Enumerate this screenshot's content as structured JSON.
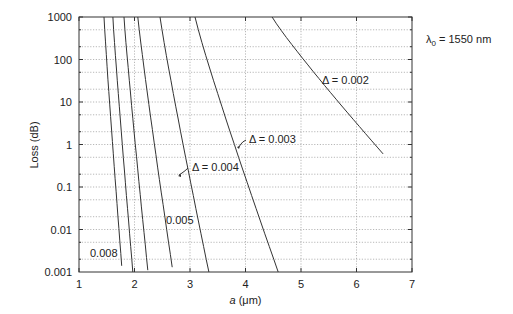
{
  "chart_data": {
    "type": "line",
    "title": "",
    "annotation": "λ₀ = 1550 nm",
    "xlabel": "a (μm)",
    "ylabel": "Loss (dB)",
    "xlim": [
      1,
      7
    ],
    "ylim": [
      0.001,
      1000
    ],
    "yscale": "log",
    "grid": true,
    "x_ticks": [
      "1",
      "2",
      "3",
      "4",
      "5",
      "6",
      "7"
    ],
    "y_ticks": [
      "1000",
      "100",
      "10",
      "1",
      "0.1",
      "0.01",
      "0.001"
    ],
    "legend": "none (inline labels)",
    "series": [
      {
        "name": "Δ=0.008",
        "label": "0.008",
        "points": [
          [
            1.45,
            1000
          ],
          [
            1.77,
            0.0014
          ]
        ]
      },
      {
        "name": "Δ=0.007 (unlabeled)",
        "label": "",
        "points": [
          [
            1.61,
            1000
          ],
          [
            1.97,
            0.001
          ]
        ]
      },
      {
        "name": "Δ=0.006 (unlabeled)",
        "label": "",
        "points": [
          [
            1.81,
            1000
          ],
          [
            2.24,
            0.0011
          ]
        ]
      },
      {
        "name": "Δ=0.005",
        "label": "0.005",
        "points": [
          [
            2.06,
            1000
          ],
          [
            2.68,
            0.0013
          ]
        ]
      },
      {
        "name": "Δ=0.004",
        "label": "Δ = 0.004",
        "points": [
          [
            2.46,
            1000
          ],
          [
            3.34,
            0.001
          ]
        ]
      },
      {
        "name": "Δ=0.003",
        "label": "Δ = 0.003",
        "points": [
          [
            3.09,
            1000
          ],
          [
            4.59,
            0.001
          ]
        ]
      },
      {
        "name": "Δ=0.002",
        "label": "Δ = 0.002",
        "points": [
          [
            4.48,
            1000
          ],
          [
            6.48,
            0.6
          ]
        ]
      }
    ]
  },
  "labels": {
    "lambda": "λ",
    "lambda_sub": "0",
    "lambda_value": " = 1550 nm",
    "xlabel_italic": "a",
    "xlabel_rest": " (μm)",
    "ylabel": "Loss (dB)",
    "d002": "Δ = 0.002",
    "d003": "Δ = 0.003",
    "d004": "Δ = 0.004",
    "d005": "0.005",
    "d008": "0.008"
  },
  "x_ticks": [
    "1",
    "2",
    "3",
    "4",
    "5",
    "6",
    "7"
  ],
  "y_ticks": [
    "1000",
    "100",
    "10",
    "1",
    "0.1",
    "0.01",
    "0.001"
  ]
}
